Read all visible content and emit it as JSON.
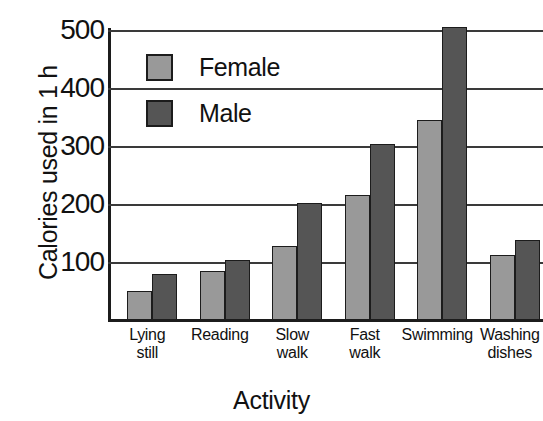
{
  "chart_data": {
    "type": "bar",
    "title": "",
    "xlabel": "Activity",
    "ylabel": "Calories used in 1 h",
    "categories": [
      "Lying still",
      "Reading",
      "Slow walk",
      "Fast walk",
      "Swimming",
      "Washing dishes"
    ],
    "category_lines": [
      [
        "Lying",
        "still"
      ],
      [
        "Reading",
        ""
      ],
      [
        "Slow",
        "walk"
      ],
      [
        "Fast",
        "walk"
      ],
      [
        "Swimming",
        ""
      ],
      [
        "Washing",
        "dishes"
      ]
    ],
    "series": [
      {
        "name": "Female",
        "color": "#999999",
        "values": [
          50,
          85,
          128,
          215,
          345,
          112
        ]
      },
      {
        "name": "Male",
        "color": "#555555",
        "values": [
          80,
          103,
          202,
          303,
          505,
          138
        ]
      }
    ],
    "ylim": [
      0,
      520
    ],
    "yticks": [
      100,
      200,
      300,
      400,
      500
    ],
    "ytick_labels": [
      "100",
      "200",
      "300",
      "400",
      "500"
    ],
    "grid": true,
    "legend_position": "inside-upper-left"
  },
  "colors": {
    "female": "#999999",
    "male": "#555555",
    "axis": "#1c1c1c",
    "grid": "#3a3a3a",
    "background": "#ffffff"
  }
}
